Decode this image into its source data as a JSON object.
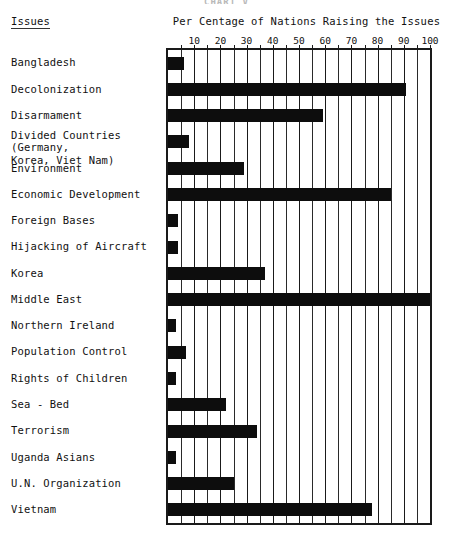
{
  "document": {
    "ghost_title": "CHART  V"
  },
  "header": {
    "issues_column_label": "Issues",
    "chart_title": "Per Centage of Nations Raising the Issues"
  },
  "chart_data": {
    "type": "bar",
    "orientation": "horizontal",
    "title": "Per Centage of Nations Raising the Issues",
    "xlabel": "",
    "ylabel": "Issues",
    "xlim": [
      0,
      100
    ],
    "grid": true,
    "grid_step": 5,
    "tick_step": 10,
    "legend": "none",
    "tick_labels": [
      "10",
      "20",
      "30",
      "40",
      "50",
      "60",
      "70",
      "80",
      "90",
      "100"
    ],
    "tick_values": [
      10,
      20,
      30,
      40,
      50,
      60,
      70,
      80,
      90,
      100
    ],
    "categories": [
      "Bangladesh",
      "Decolonization",
      "Disarmament",
      "Divided Countries (Germany,\nKorea, Viet Nam)",
      "Environment",
      "Economic Development",
      "Foreign Bases",
      "Hijacking of Aircraft",
      "Korea",
      "Middle East",
      "Northern Ireland",
      "Population Control",
      "Rights of Children",
      "Sea - Bed",
      "Terrorism",
      "Uganda Asians",
      "U.N. Organization",
      "Vietnam"
    ],
    "values": [
      6,
      91,
      59,
      8,
      29,
      85,
      4,
      4,
      37,
      100,
      3,
      7,
      3,
      22,
      34,
      3,
      25,
      78
    ]
  },
  "colors": {
    "bar": "#0d0d0d",
    "frame": "#1a1a1a",
    "grid": "#2a2a2a",
    "text": "#111111",
    "background": "#ffffff"
  }
}
